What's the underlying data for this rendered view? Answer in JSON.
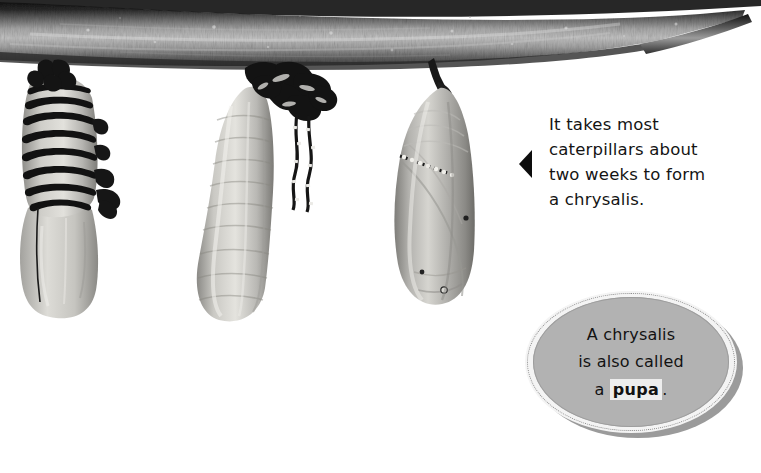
{
  "page": {
    "background_color": "#ffffff",
    "width": 761,
    "height": 473
  },
  "scene": {
    "branch": {
      "name": "tree-branch",
      "description": "horizontal textured branch across top of image",
      "dark_color": "#1f1f1f",
      "mid_color": "#8d8d8d",
      "light_color": "#d8d8d8"
    },
    "specimens": [
      {
        "name": "caterpillar-shedding-skin",
        "stage_label": "striped caterpillar splitting its skin",
        "body_color": "#b9b8b4",
        "stripe_color": "#111111"
      },
      {
        "name": "caterpillar-soft-pupa",
        "stage_label": "soft pupa with shed skin at top",
        "body_color": "#b7b6b2",
        "stripe_color": "#121212"
      },
      {
        "name": "chrysalis",
        "stage_label": "formed chrysalis hanging from branch",
        "body_color": "#a7a6a2",
        "stripe_color": "#1a1a1a"
      }
    ]
  },
  "callout_text": {
    "name": "fact-callout",
    "arrow_color": "#0d0d0d",
    "lines": [
      "It takes most",
      "caterpillars about",
      "two weeks to form",
      "a chrysalis."
    ]
  },
  "circle_callout": {
    "name": "pupa-circle-callout",
    "fill_color": "#b2b2b2",
    "ring_color": "#f4f4f4",
    "shadow_color": "#9b9b9b",
    "highlight_color": "#ededed",
    "line1": "A chrysalis",
    "line2": "is also called",
    "line3_prefix": "a",
    "line3_bold": "pupa",
    "line3_suffix": "."
  }
}
